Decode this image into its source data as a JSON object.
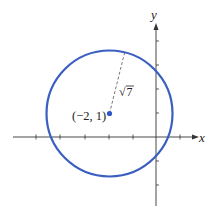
{
  "figure": {
    "type": "circle-on-coordinate-plane",
    "axes": {
      "x_label": "x",
      "y_label": "y",
      "tick_spacing_px": 24,
      "x_ticks": [
        -5,
        -4,
        -3,
        -2,
        -1,
        1
      ],
      "y_ticks": [
        4,
        3,
        2,
        1,
        -1,
        -2
      ]
    },
    "circle": {
      "center": [
        -2,
        1
      ],
      "radius_label": "√7",
      "radius_value": 2.6458,
      "color": "#3a5fc0"
    },
    "center_label": "(−2, 1)",
    "radius_text": {
      "radical": "√",
      "radicand": "7"
    },
    "colors": {
      "axis": "#333333",
      "circle": "#3a5fc0",
      "center_point": "#2e56c6",
      "dashed_radius": "#555555"
    }
  }
}
